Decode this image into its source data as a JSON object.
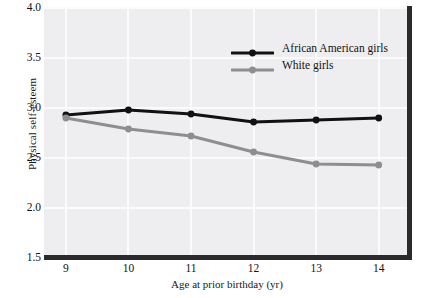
{
  "chart_data": {
    "type": "line",
    "title": "",
    "xlabel": "Age at prior birthday (yr)",
    "ylabel": "Physical self-esteem",
    "x": [
      9,
      10,
      11,
      12,
      13,
      14
    ],
    "xtick_labels": [
      "9",
      "10",
      "11",
      "12",
      "13",
      "14"
    ],
    "ytick_labels": [
      "1.5",
      "2.0",
      "2.5",
      "3.0",
      "3.5",
      "4.0"
    ],
    "yticks": [
      1.5,
      2.0,
      2.5,
      3.0,
      3.5,
      4.0
    ],
    "xlim": [
      8.65,
      14.5
    ],
    "ylim": [
      1.5,
      4.0
    ],
    "grid": true,
    "legend_position": "upper right",
    "series": [
      {
        "name": "African American girls",
        "color": "#111111",
        "marker": "circle",
        "values": [
          2.93,
          2.98,
          2.94,
          2.86,
          2.88,
          2.9
        ]
      },
      {
        "name": "White girls",
        "color": "#8e8e8e",
        "marker": "circle",
        "values": [
          2.9,
          2.79,
          2.72,
          2.56,
          2.44,
          2.43
        ]
      }
    ]
  },
  "colors": {
    "plot_background": "#eeeef0",
    "gridline": "#fbfbfc",
    "axis": "#2b2b2d",
    "figure_background": "#ffffff",
    "text": "#121214"
  }
}
